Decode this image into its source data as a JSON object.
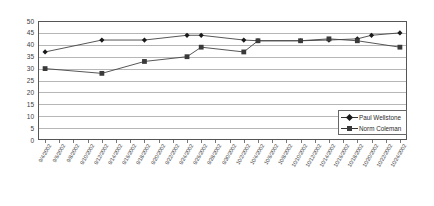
{
  "chart_data": {
    "type": "line",
    "title": "",
    "xlabel": "",
    "ylabel": "",
    "ylim": [
      0,
      50
    ],
    "ytick_step": 5,
    "grid": true,
    "legend_position": "bottom-right",
    "categories": [
      "9/4/2002",
      "9/6/2002",
      "9/8/2002",
      "9/10/2002",
      "9/12/2002",
      "9/14/2002",
      "9/16/2002",
      "9/18/2002",
      "9/20/2002",
      "9/22/2002",
      "9/24/2002",
      "9/26/2002",
      "9/28/2002",
      "9/30/2002",
      "10/2/2002",
      "10/4/2002",
      "10/6/2002",
      "10/8/2002",
      "10/10/2002",
      "10/12/2002",
      "10/14/2002",
      "10/16/2002",
      "10/18/2002",
      "10/20/2002",
      "10/22/2002",
      "10/24/2002"
    ],
    "yticks": [
      0,
      5,
      10,
      15,
      20,
      25,
      30,
      35,
      40,
      45,
      50
    ],
    "series": [
      {
        "name": "Paul Wellstone",
        "marker": "diamond",
        "color": "#1a1a1a",
        "points": [
          {
            "x": "9/4/2002",
            "y": 37
          },
          {
            "x": "9/12/2002",
            "y": 42
          },
          {
            "x": "9/18/2002",
            "y": 42
          },
          {
            "x": "9/24/2002",
            "y": 44
          },
          {
            "x": "9/26/2002",
            "y": 44
          },
          {
            "x": "10/2/2002",
            "y": 42
          },
          {
            "x": "10/4/2002",
            "y": 41.7
          },
          {
            "x": "10/10/2002",
            "y": 41.7
          },
          {
            "x": "10/14/2002",
            "y": 42
          },
          {
            "x": "10/18/2002",
            "y": 42.5
          },
          {
            "x": "10/20/2002",
            "y": 44
          },
          {
            "x": "10/24/2002",
            "y": 45
          }
        ]
      },
      {
        "name": "Norm Coleman",
        "marker": "square",
        "color": "#3a3a3a",
        "points": [
          {
            "x": "9/4/2002",
            "y": 30
          },
          {
            "x": "9/12/2002",
            "y": 28
          },
          {
            "x": "9/18/2002",
            "y": 33
          },
          {
            "x": "9/24/2002",
            "y": 35
          },
          {
            "x": "9/26/2002",
            "y": 39
          },
          {
            "x": "10/2/2002",
            "y": 37
          },
          {
            "x": "10/4/2002",
            "y": 41.7
          },
          {
            "x": "10/10/2002",
            "y": 41.7
          },
          {
            "x": "10/14/2002",
            "y": 42.5
          },
          {
            "x": "10/18/2002",
            "y": 41.7
          },
          {
            "x": "10/24/2002",
            "y": 39
          }
        ]
      }
    ],
    "legend": [
      {
        "label": "Paul Wellstone",
        "marker": "diamond"
      },
      {
        "label": "Norm Coleman",
        "marker": "square"
      }
    ]
  }
}
